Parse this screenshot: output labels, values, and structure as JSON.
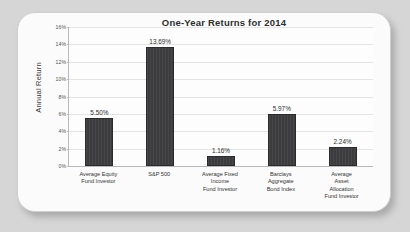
{
  "chart_data": {
    "type": "bar",
    "title": "One-Year Returns for 2014",
    "xlabel": "",
    "ylabel": "Annual Return",
    "ylim": [
      0,
      16
    ],
    "grid": true,
    "legend": "none",
    "ytick_labels": [
      "0%",
      "2%",
      "4%",
      "6%",
      "8%",
      "10%",
      "12%",
      "14%",
      "16%"
    ],
    "ytick_values": [
      0,
      2,
      4,
      6,
      8,
      10,
      12,
      14,
      16
    ],
    "categories": [
      "Average Equity Fund Investor",
      "S&P 500",
      "Average Fixed Income Fund Investor",
      "Barclays Aggregate Bond Index",
      "Average Asset Allocation Fund Investor"
    ],
    "category_lines": [
      [
        "Average Equity",
        "Fund Investor"
      ],
      [
        "S&P 500"
      ],
      [
        "Average Fixed",
        "Income",
        "Fund Investor"
      ],
      [
        "Barclays",
        "Aggregate",
        "Bond Index"
      ],
      [
        "Average",
        "Asset",
        "Allocation",
        "Fund Investor"
      ]
    ],
    "values": [
      5.5,
      13.69,
      1.16,
      5.97,
      2.24
    ],
    "value_labels": [
      "5.50%",
      "13.69%",
      "1.16%",
      "5.97%",
      "2.24%"
    ],
    "bar_color": "#3c3c3e",
    "plot_background": "#fdfdfd",
    "panel_background": "#fbfbfb",
    "page_background": "#d6d6d6"
  }
}
